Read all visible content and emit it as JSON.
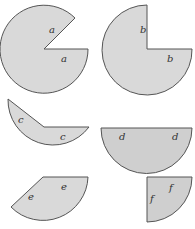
{
  "figure": {
    "width": 195,
    "height": 229,
    "background": "#ffffff",
    "fill_light": "#d9d9d9",
    "fill_dark": "#cfcfcf",
    "stroke": "#555555",
    "shapes": [
      {
        "id": "a",
        "kind": "circle-minus-wedge",
        "labels": [
          "a",
          "a"
        ]
      },
      {
        "id": "b",
        "kind": "three-quarter-circle",
        "labels": [
          "b",
          "b"
        ]
      },
      {
        "id": "c",
        "kind": "major-sector",
        "labels": [
          "c",
          "c"
        ]
      },
      {
        "id": "d",
        "kind": "semicircle",
        "labels": [
          "d",
          "d"
        ]
      },
      {
        "id": "e",
        "kind": "sector",
        "labels": [
          "e",
          "e"
        ]
      },
      {
        "id": "f",
        "kind": "quarter-circle",
        "labels": [
          "f",
          "f"
        ]
      }
    ]
  },
  "labels": {
    "a1": "a",
    "a2": "a",
    "b1": "b",
    "b2": "b",
    "c1": "c",
    "c2": "c",
    "d1": "d",
    "d2": "d",
    "e1": "e",
    "e2": "e",
    "f1": "f",
    "f2": "f"
  }
}
